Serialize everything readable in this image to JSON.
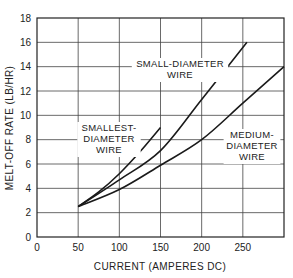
{
  "chart_data": {
    "type": "line",
    "title": "",
    "xlabel": "CURRENT (AMPERES DC)",
    "ylabel": "MELT-OFF RATE (LB/HR)",
    "xlim": [
      0,
      300
    ],
    "ylim": [
      0,
      18
    ],
    "x_ticks": [
      "0",
      "50",
      "100",
      "150",
      "200",
      "250"
    ],
    "y_ticks": [
      "0",
      "2",
      "4",
      "6",
      "8",
      "10",
      "12",
      "14",
      "16",
      "18"
    ],
    "grid": true,
    "legend": "none (inline labels)",
    "series": [
      {
        "name": "SMALLEST-DIAMETER WIRE",
        "label_lines": [
          "SMALLEST-",
          "DIAMETER",
          "WIRE"
        ],
        "x": [
          50,
          75,
          100,
          125,
          150
        ],
        "y": [
          2.5,
          3.7,
          5.2,
          7.0,
          9.0
        ]
      },
      {
        "name": "SMALL-DIAMETER WIRE",
        "label_lines": [
          "SMALL-DIAMETER",
          "WIRE"
        ],
        "x": [
          50,
          100,
          150,
          200,
          255
        ],
        "y": [
          2.5,
          4.7,
          7.1,
          11.3,
          16.0
        ]
      },
      {
        "name": "MEDIUM-DIAMETER WIRE",
        "label_lines": [
          "MEDIUM-",
          "DIAMETER",
          "WIRE"
        ],
        "x": [
          50,
          100,
          150,
          200,
          250,
          300
        ],
        "y": [
          2.5,
          3.9,
          5.9,
          8.0,
          11.0,
          14.0
        ]
      }
    ]
  }
}
